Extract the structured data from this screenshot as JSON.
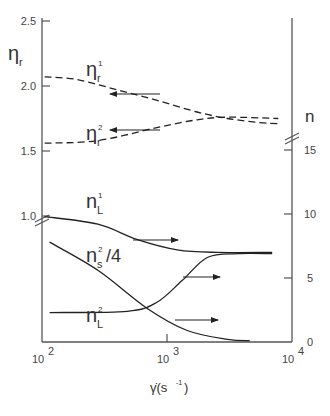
{
  "chart_data": {
    "type": "line",
    "title": "",
    "xlabel": "γ̇ (s⁻¹)",
    "xscale": "log",
    "xlim": [
      100,
      10000
    ],
    "xticks": [
      {
        "value": 100,
        "base": "10",
        "exp": "2"
      },
      {
        "value": 1000,
        "base": "10",
        "exp": "3"
      },
      {
        "value": 10000,
        "base": "10",
        "exp": "4"
      }
    ],
    "y_left": {
      "label": "η",
      "label_sub": "r",
      "ylim": [
        1.0,
        2.5
      ],
      "ticks": [
        "2.5",
        "2.0",
        "1.5",
        "1.0"
      ],
      "tick_values": [
        2.5,
        2.0,
        1.5,
        1.0
      ],
      "axis_break_below": 1.0
    },
    "y_right": {
      "label": "n",
      "ylim": [
        0,
        15
      ],
      "ticks": [
        "15",
        "10",
        "5",
        "0"
      ],
      "tick_values": [
        15,
        10,
        5,
        0
      ],
      "axis_break_above": 15
    },
    "series": [
      {
        "name": "eta-r-1",
        "axis": "left",
        "style": "dashed",
        "label": {
          "main": "η",
          "sub": "r",
          "sup": "1"
        },
        "x": [
          105,
          190,
          400,
          830,
          1740,
          3050,
          5340,
          7770
        ],
        "y": [
          2.07,
          2.05,
          1.97,
          1.89,
          1.8,
          1.75,
          1.72,
          1.71
        ]
      },
      {
        "name": "eta-r-2",
        "axis": "left",
        "style": "dashed",
        "label": {
          "main": "η",
          "sub": "r",
          "sup": "2"
        },
        "x": [
          105,
          280,
          830,
          1740,
          3050,
          7770
        ],
        "y": [
          1.56,
          1.58,
          1.68,
          1.74,
          1.76,
          1.75
        ]
      },
      {
        "name": "n-L-1",
        "axis": "right",
        "style": "solid",
        "label": {
          "main": "n",
          "sub": "L",
          "sup": "1"
        },
        "x": [
          105,
          280,
          580,
          1210,
          2520,
          6940
        ],
        "y": [
          9.8,
          9.2,
          8.0,
          7.2,
          7.0,
          7.0
        ]
      },
      {
        "name": "n-s-2-over-4",
        "axis": "right",
        "style": "solid",
        "label": {
          "main": "n",
          "sub": "s",
          "sup": "2",
          "suffix": "/4"
        },
        "x": [
          115,
          280,
          700,
          1450,
          3050,
          4590
        ],
        "y": [
          7.8,
          5.6,
          2.6,
          0.9,
          0.2,
          0.1
        ]
      },
      {
        "name": "n-L-2",
        "axis": "right",
        "style": "solid",
        "label": {
          "main": "n",
          "sub": "L",
          "sup": "2"
        },
        "x": [
          115,
          480,
          830,
          1320,
          2100,
          3660,
          6940
        ],
        "y": [
          2.3,
          2.4,
          3.1,
          4.8,
          6.6,
          6.9,
          6.9
        ]
      }
    ],
    "arrows": [
      {
        "series": "eta-r-1",
        "direction": "left",
        "points_to": "left axis"
      },
      {
        "series": "eta-r-2",
        "direction": "left",
        "points_to": "left axis"
      },
      {
        "series": "n-L-1",
        "direction": "right",
        "points_to": "right axis"
      },
      {
        "series": "n-s-2-over-4",
        "direction": "right",
        "points_to": "right axis"
      },
      {
        "series": "n-L-2",
        "direction": "right",
        "points_to": "right axis"
      }
    ],
    "legend": "inline labels",
    "grid": false
  }
}
